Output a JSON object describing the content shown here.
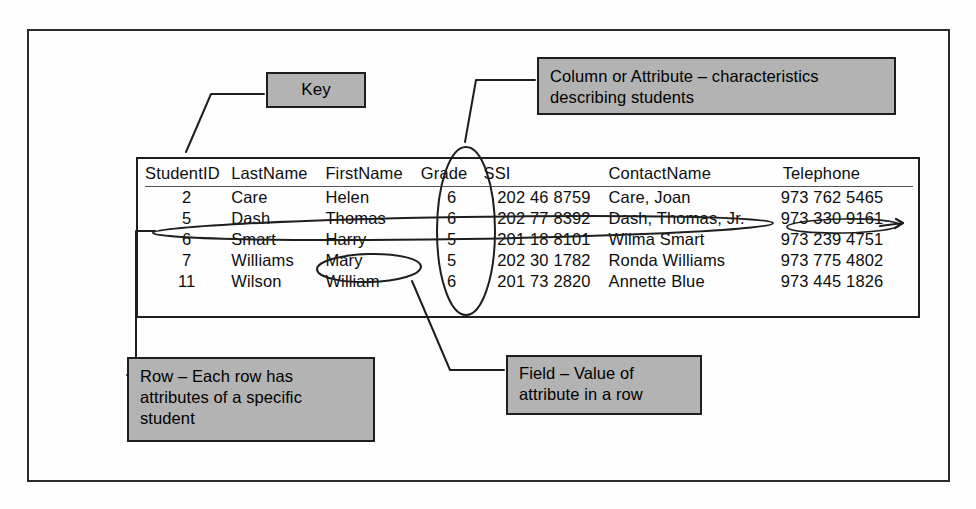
{
  "diagram": {
    "title_context": "Relational table terminology diagram",
    "callouts": {
      "key": "Key",
      "column": "Column or Attribute – characteristics\ndescribing students",
      "row": "Row – Each row has\nattributes of a specific\nstudent",
      "field": "Field – Value of\nattribute in a row"
    },
    "colors": {
      "callout_fill": "#b3b3b3",
      "callout_border": "#1e1e1e",
      "ink": "#0d0d0d",
      "page_background": "#ffffff"
    },
    "annotation_shapes": [
      {
        "name": "key-leader-line",
        "type": "polyline",
        "target": "StudentID column"
      },
      {
        "name": "column-leader-line",
        "type": "polyline",
        "target": "Grade column header"
      },
      {
        "name": "grade-column-ellipse",
        "type": "ellipse",
        "target": "Grade column"
      },
      {
        "name": "row-ellipse",
        "type": "ellipse",
        "target": "row 5 Dash Thomas"
      },
      {
        "name": "row-leader-line",
        "type": "polyline",
        "target": "Row callout"
      },
      {
        "name": "mary-field-ellipse",
        "type": "ellipse",
        "target": "Mary field"
      },
      {
        "name": "field-leader-line",
        "type": "polyline",
        "target": "Field callout"
      },
      {
        "name": "telephone-field-strike",
        "type": "ellipse",
        "target": "973 330 9161"
      }
    ]
  },
  "table": {
    "headers": [
      "StudentID",
      "LastName",
      "FirstName",
      "Grade",
      "SSI",
      "ContactName",
      "Telephone"
    ],
    "rows": [
      {
        "StudentID": "2",
        "LastName": "Care",
        "FirstName": "Helen",
        "Grade": "6",
        "SSI": "202 46 8759",
        "ContactName": "Care, Joan",
        "Telephone": "973 762 5465"
      },
      {
        "StudentID": "5",
        "LastName": "Dash",
        "FirstName": "Thomas",
        "Grade": "6",
        "SSI": "202 77 8392",
        "ContactName": "Dash, Thomas, Jr.",
        "Telephone": "973 330 9161"
      },
      {
        "StudentID": "6",
        "LastName": "Smart",
        "FirstName": "Harry",
        "Grade": "5",
        "SSI": "201 18 8101",
        "ContactName": "Wilma Smart",
        "Telephone": "973 239 4751"
      },
      {
        "StudentID": "7",
        "LastName": "Williams",
        "FirstName": "Mary",
        "Grade": "5",
        "SSI": "202 30 1782",
        "ContactName": "Ronda Williams",
        "Telephone": "973 775 4802"
      },
      {
        "StudentID": "11",
        "LastName": "Wilson",
        "FirstName": "William",
        "Grade": "6",
        "SSI": "201 73 2820",
        "ContactName": "Annette Blue",
        "Telephone": "973 445 1826"
      }
    ]
  }
}
